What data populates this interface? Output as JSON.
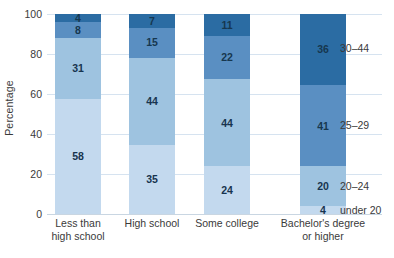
{
  "chart_data": {
    "type": "bar",
    "stacked": true,
    "title": "",
    "xlabel": "",
    "ylabel": "Percentage",
    "ylim": [
      0,
      100
    ],
    "yticks": [
      0,
      20,
      40,
      60,
      80,
      100
    ],
    "grid": true,
    "legend_position": "right-of-last-bar",
    "categories": [
      "Less than high school",
      "High school",
      "Some college",
      "Bachelor's degree or higher"
    ],
    "category_lines": [
      [
        "Less than",
        "high school"
      ],
      [
        "High school"
      ],
      [
        "Some college"
      ],
      [
        "Bachelor's degree",
        "or higher"
      ]
    ],
    "series": [
      {
        "name": "under 20",
        "color": "#c3d9ee",
        "values": [
          58,
          35,
          24,
          4
        ]
      },
      {
        "name": "20–24",
        "color": "#9ec3e0",
        "values": [
          31,
          44,
          44,
          20
        ]
      },
      {
        "name": "25–29",
        "color": "#5a8fc2",
        "values": [
          8,
          15,
          22,
          41
        ]
      },
      {
        "name": "30–44",
        "color": "#2b6ca3",
        "values": [
          4,
          7,
          11,
          36
        ]
      }
    ],
    "legend_entries": [
      "30–44",
      "25–29",
      "20–24",
      "under 20"
    ]
  }
}
